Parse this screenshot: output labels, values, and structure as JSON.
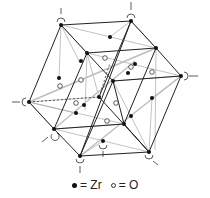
{
  "figure": {
    "type": "crystal-structure-diagram"
  },
  "legend": {
    "zr_label": "= Zr",
    "o_label": "= O"
  },
  "colors": {
    "line_dark": "#222222",
    "line_light": "#999999",
    "atom_zr": "#111111",
    "atom_o_stroke": "#333333",
    "background": "#ffffff"
  }
}
